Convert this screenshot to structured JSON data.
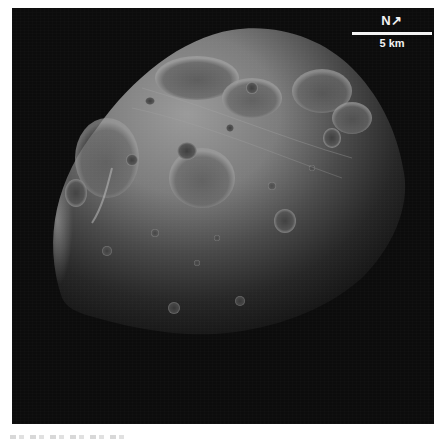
{
  "image": {
    "subject": "Phobos moon surface image",
    "background_color": "#0c0c0c",
    "surface_color": "#8a8a8a"
  },
  "scale_bar": {
    "north_label": "N",
    "north_arrow": "↗",
    "distance_label": "5 km",
    "color": "#f5f5f5"
  },
  "caption": {
    "text": ""
  }
}
